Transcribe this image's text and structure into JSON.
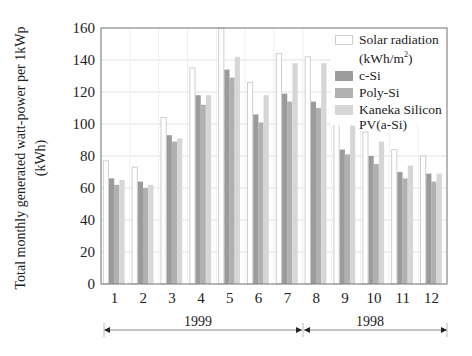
{
  "chart_data": {
    "type": "bar",
    "title": "",
    "xlabel": "",
    "ylabel": "Total monthly generated watt-power per 1kWp",
    "ylabel_unit": "(kWh)",
    "ylim": [
      0,
      160
    ],
    "yticks": [
      0,
      20,
      40,
      60,
      80,
      100,
      120,
      140,
      160
    ],
    "grid": true,
    "legend_position": "upper right, inside plot",
    "categories": [
      "1",
      "2",
      "3",
      "4",
      "5",
      "6",
      "7",
      "8",
      "9",
      "10",
      "11",
      "12"
    ],
    "series": [
      {
        "name": "Solar radiation (kWh/m²)",
        "color": "#ffffff",
        "stroke": "#cfcfcf",
        "values": [
          77,
          73,
          104,
          135,
          160,
          126,
          144,
          142,
          102,
          95,
          84,
          80
        ]
      },
      {
        "name": "c-Si",
        "color": "#9b9b9b",
        "values": [
          66,
          64,
          93,
          118,
          134,
          106,
          119,
          114,
          84,
          80,
          70,
          69
        ]
      },
      {
        "name": "Poly-Si",
        "color": "#b0b0b0",
        "values": [
          62,
          60,
          89,
          112,
          129,
          101,
          114,
          110,
          81,
          75,
          66,
          64
        ]
      },
      {
        "name": "Kaneka Silicon PV(a-Si)",
        "color": "#d6d6d6",
        "values": [
          65,
          62,
          91,
          118,
          142,
          118,
          138,
          138,
          99,
          89,
          74,
          69
        ]
      }
    ],
    "annotations": [
      {
        "text": "1999",
        "span_months": [
          "1",
          "7"
        ]
      },
      {
        "text": "1998",
        "span_months": [
          "8",
          "12"
        ]
      }
    ]
  },
  "legend": {
    "items": [
      {
        "line1": "Solar radiation",
        "line2": "(kWh/m",
        "sup": "2",
        "tail": ")"
      },
      {
        "line1": "c-Si"
      },
      {
        "line1": "Poly-Si"
      },
      {
        "line1": "Kaneka Silicon",
        "line2": "PV(a-Si)"
      }
    ]
  },
  "axis": {
    "ylabel_line1": "Total monthly generated watt-power per 1kWp",
    "ylabel_line2": "(kWh)"
  },
  "periods": [
    {
      "label": "1999"
    },
    {
      "label": "1998"
    }
  ]
}
